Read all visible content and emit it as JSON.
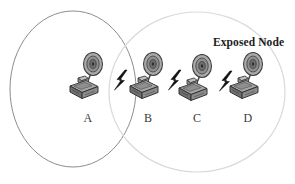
{
  "figure": {
    "title_annotation": "Exposed Node",
    "background_color": "#ffffff"
  },
  "coverage_areas": [
    {
      "id": "range-a",
      "name": "transmission-range-left",
      "cx": 73,
      "cy": 89,
      "rx": 63,
      "ry": 78,
      "stroke": "#8d8d8d"
    },
    {
      "id": "range-c",
      "name": "transmission-range-right",
      "cx": 197,
      "cy": 92,
      "rx": 88,
      "ry": 80,
      "stroke": "#d8d8d8"
    }
  ],
  "nodes": [
    {
      "label": "A",
      "x": 88,
      "y": 78,
      "label_x": 76,
      "label_y": 112
    },
    {
      "label": "B",
      "x": 148,
      "y": 78,
      "label_x": 136,
      "label_y": 112
    },
    {
      "label": "C",
      "x": 197,
      "y": 80,
      "label_x": 185,
      "label_y": 112
    },
    {
      "label": "D",
      "x": 248,
      "y": 78,
      "label_x": 236,
      "label_y": 112
    }
  ],
  "links": [
    {
      "from": "A",
      "to": "B",
      "x": 117,
      "y": 76,
      "icon": "lightning-bolt-icon"
    },
    {
      "from": "B",
      "to": "C",
      "x": 171,
      "y": 76,
      "icon": "lightning-bolt-icon"
    },
    {
      "from": "C",
      "to": "D",
      "x": 222,
      "y": 78,
      "icon": "lightning-bolt-icon"
    }
  ],
  "annotation": {
    "text": "Exposed Node",
    "x": 213,
    "y": 36
  },
  "colors": {
    "bolt": "#111111",
    "computer_body": "#8a8a8a",
    "computer_dark": "#5c5c5c",
    "computer_light": "#b4b4b4",
    "dish": "#9a9a9a",
    "outline": "#3a3a3a"
  }
}
